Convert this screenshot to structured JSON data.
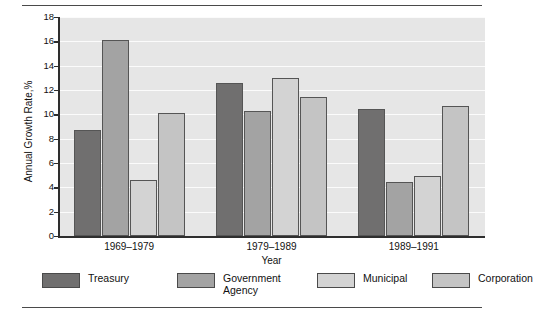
{
  "figure": {
    "top_rule": "horizontal-rule",
    "bottom_rule": "horizontal-rule"
  },
  "chart_data": {
    "type": "bar",
    "title": "",
    "xlabel": "Year",
    "ylabel": "Annual Growth Rate,%",
    "categories": [
      "1969–1979",
      "1979–1989",
      "1989–1991"
    ],
    "series": [
      {
        "name": "Treasury",
        "color": "#706f6f",
        "values": [
          8.7,
          12.6,
          10.4
        ]
      },
      {
        "name": "Government\nAgency",
        "color": "#a3a3a3",
        "values": [
          16.1,
          10.3,
          4.4
        ]
      },
      {
        "name": "Municipal",
        "color": "#d3d3d3",
        "values": [
          4.6,
          13.0,
          4.9
        ]
      },
      {
        "name": "Corporation",
        "color": "#c4c4c4",
        "values": [
          10.1,
          11.4,
          10.7
        ]
      }
    ],
    "ylim": [
      0,
      18
    ],
    "yticks": [
      0,
      2,
      4,
      6,
      8,
      10,
      12,
      14,
      16,
      18
    ],
    "ytick_labels": [
      "0",
      "2",
      "4",
      "6",
      "8",
      "10",
      "12",
      "14",
      "16",
      "18"
    ],
    "grid": true,
    "grid_axis": "y",
    "grid_color": "#fbfbfb",
    "plot_background": "#e6e6e6",
    "legend_position": "below",
    "legend_entries": [
      "Treasury",
      "Government\nAgency",
      "Municipal",
      "Corporation"
    ]
  }
}
